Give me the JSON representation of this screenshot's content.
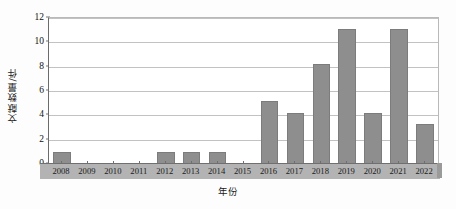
{
  "chart_data": {
    "type": "bar",
    "title": "",
    "subtitle": "",
    "xlabel": "年份",
    "ylabel": "文献数量/件",
    "categories": [
      "2008",
      "2009",
      "2010",
      "2011",
      "2012",
      "2013",
      "2014",
      "2015",
      "2016",
      "2017",
      "2018",
      "2019",
      "2020",
      "2021",
      "2022"
    ],
    "values": [
      1,
      0,
      0,
      0,
      1,
      1,
      1,
      0,
      5.2,
      4.2,
      8.2,
      11.1,
      4.2,
      11.1,
      3.3
    ],
    "series": [
      {
        "name": "文献数量",
        "values": [
          1,
          0,
          0,
          0,
          1,
          1,
          1,
          0,
          5.2,
          4.2,
          8.2,
          11.1,
          4.2,
          11.1,
          3.3
        ]
      }
    ],
    "ylim": [
      0,
      12
    ],
    "yticks": [
      0,
      2,
      4,
      6,
      8,
      10,
      12
    ],
    "ytick_labels": [
      "0",
      "2",
      "4",
      "6",
      "8",
      "10",
      "12"
    ],
    "grid": "horizontal",
    "legend": "none",
    "bar_color": "#8e8e8e",
    "grid_color": "#c2c2c2",
    "axis_color": "#6b6b6b",
    "background_color": "#ffffff"
  }
}
